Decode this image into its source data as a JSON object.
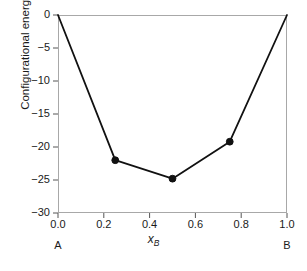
{
  "chart_data": {
    "type": "line",
    "title": "",
    "xlabel": "x_B",
    "xlabel_base": "x",
    "xlabel_sub": "B",
    "ylabel": "Configurational energy",
    "xlim": [
      0.0,
      1.0
    ],
    "ylim": [
      -30,
      0
    ],
    "grid": false,
    "legend": null,
    "x": [
      0.0,
      0.25,
      0.5,
      0.75,
      1.0
    ],
    "values": [
      0.0,
      -22.0,
      -24.8,
      -19.2,
      0.0
    ],
    "markers_shown_at": [
      0.25,
      0.5,
      0.75
    ],
    "series": [
      {
        "name": "Configurational energy",
        "x": [
          0.0,
          0.25,
          0.5,
          0.75,
          1.0
        ],
        "values": [
          0.0,
          -22.0,
          -24.8,
          -19.2,
          0.0
        ]
      }
    ],
    "xticks": [
      0.0,
      0.2,
      0.4,
      0.6,
      0.8,
      1.0
    ],
    "xtick_labels": [
      "0.0",
      "0.2",
      "0.4",
      "0.6",
      "0.8",
      "1.0"
    ],
    "yticks": [
      0,
      -5,
      -10,
      -15,
      -20,
      -25,
      -30
    ],
    "ytick_labels": [
      "0",
      "−5",
      "−10",
      "−15",
      "−20",
      "−25",
      "−30"
    ],
    "endcap_labels": [
      {
        "x": 0.0,
        "label": "A"
      },
      {
        "x": 1.0,
        "label": "B"
      }
    ],
    "line_color": "#111111",
    "marker_color": "#111111",
    "spine_color": "#a8a8a8",
    "tick_color": "#555555",
    "background": "#ffffff"
  }
}
